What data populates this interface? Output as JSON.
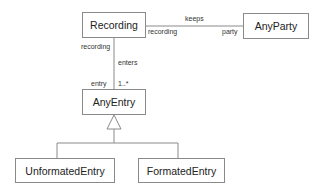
{
  "diagram": {
    "type": "UML class diagram",
    "classes": [
      {
        "id": "recording",
        "name": "Recording"
      },
      {
        "id": "anyparty",
        "name": "AnyParty"
      },
      {
        "id": "anyentry",
        "name": "AnyEntry"
      },
      {
        "id": "unformatedentry",
        "name": "UnformatedEntry"
      },
      {
        "id": "formatedentry",
        "name": "FormatedEntry"
      }
    ],
    "associations": [
      {
        "name": "keeps",
        "from": "Recording",
        "to": "AnyParty",
        "from_role": "recording",
        "to_role": "party"
      },
      {
        "name": "enters",
        "from": "Recording",
        "to": "AnyEntry",
        "from_role": "recording",
        "to_role": "entry",
        "to_multiplicity": "1..*"
      }
    ],
    "generalizations": [
      {
        "parent": "AnyEntry",
        "children": [
          "UnformatedEntry",
          "FormatedEntry"
        ]
      }
    ]
  }
}
